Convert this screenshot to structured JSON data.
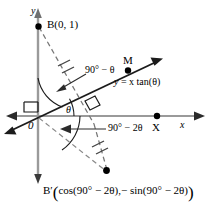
{
  "figure": {
    "type": "geometry-diagram",
    "background_color": "#ffffff",
    "ink_color": "#000000",
    "axis_color": "#808080",
    "width": 213,
    "height": 207
  },
  "axes": {
    "y_label": "y",
    "x_label": "x",
    "origin_label": "0"
  },
  "points": {
    "b": "B(0, 1)",
    "m": "M",
    "x": "X",
    "b_prime_name": "B′",
    "b_prime_open_paren": "(",
    "b_prime_coord_x": "cos(90° − 2θ),",
    "b_prime_coord_y": "− sin(90° − 2θ)",
    "b_prime_close_paren": ")"
  },
  "labels": {
    "line_equation_y": "y",
    "line_equation_rest": " = x tan(θ)",
    "angle_theta": "θ",
    "angle_90_minus_theta": "90° − θ",
    "angle_90_minus_2theta": "90° − 2θ"
  }
}
